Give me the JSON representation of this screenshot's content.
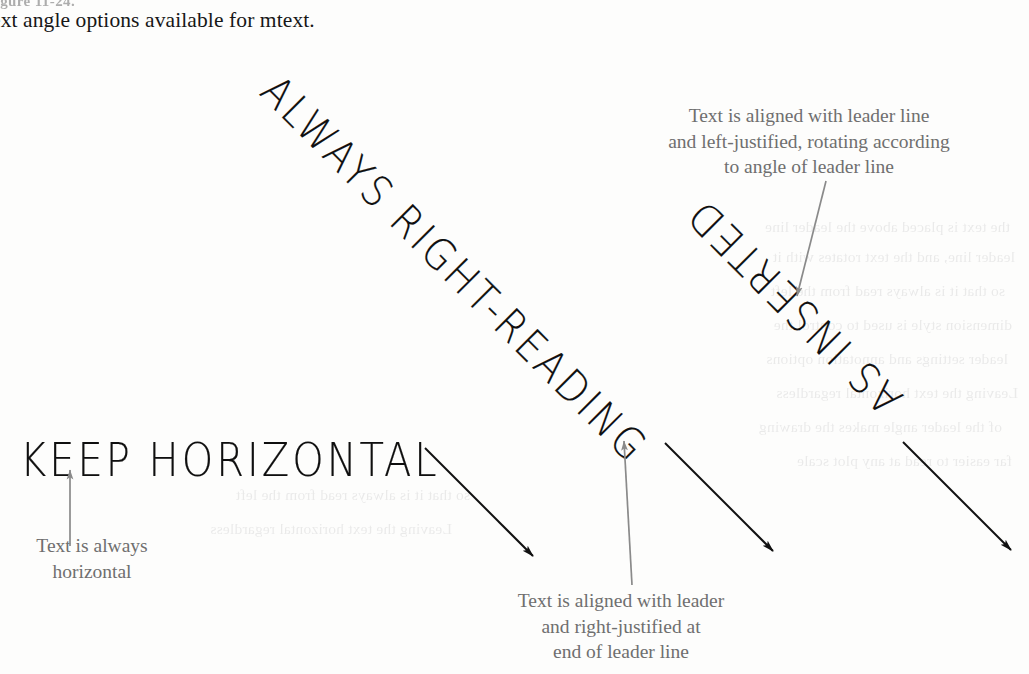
{
  "figure": {
    "caption_cut": "Figure 11-24.",
    "caption_line": "ext angle options available for mtext.",
    "page_background": "#fdfdfc",
    "cad_text_color": "#0f0f0f",
    "annotation_color": "#6f6f6f",
    "leader_color": "#111111",
    "callout_color": "#8a8a8a"
  },
  "cad_labels": {
    "keep_horizontal": "KEEP HORIZONTAL",
    "always_right_reading": "ALWAYS RIGHT-READING",
    "as_inserted": "AS INSERTED"
  },
  "annotations": {
    "always_horizontal": "Text is always\nhorizontal",
    "right_justified": "Text is aligned with leader\nand right-justified at\nend of leader line",
    "left_justified": "Text is aligned with leader line\nand left-justified, rotating according\nto angle of leader line"
  },
  "ghost_text": {
    "lines": [
      "the text is placed above the leader line",
      "leader line, and the text rotates with it",
      "so that it is always read from the left",
      "dimension style is used to control the",
      "leader settings and annotation options",
      "Leaving the text horizontal regardless",
      "of the leader angle makes the drawing",
      "far easier to read at any plot scale"
    ]
  },
  "leaders": [
    {
      "name": "leader-keep-horizontal",
      "x1": 425,
      "y1": 448,
      "x2": 533,
      "y2": 556
    },
    {
      "name": "leader-right-reading",
      "x1": 665,
      "y1": 443,
      "x2": 773,
      "y2": 551
    },
    {
      "name": "leader-as-inserted",
      "x1": 903,
      "y1": 442,
      "x2": 1011,
      "y2": 550
    }
  ],
  "callouts": [
    {
      "name": "callout-horizontal",
      "x1": 70,
      "y1": 545,
      "x2": 70,
      "y2": 470
    },
    {
      "name": "callout-rightjust",
      "x1": 631,
      "y1": 583,
      "x2": 624,
      "y2": 440
    },
    {
      "name": "callout-leftjust",
      "x1": 825,
      "y1": 182,
      "x2": 797,
      "y2": 295
    }
  ]
}
